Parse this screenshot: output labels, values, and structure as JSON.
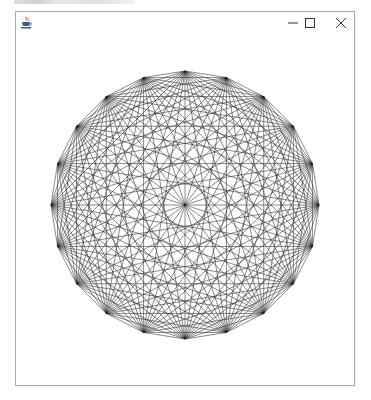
{
  "window": {
    "title": "",
    "icon": "java-coffee-cup-icon",
    "controls": {
      "minimize_glyph": "—",
      "maximize_glyph": "☐",
      "close_glyph": "✕"
    }
  },
  "canvas": {
    "background": "#ffffff",
    "line_color": "#1a1a1a",
    "line_width": 0.6,
    "graph": {
      "type": "complete-graph",
      "vertex_count": 20,
      "center_x": 184,
      "center_y": 204,
      "radius": 134,
      "start_angle_deg": -90
    }
  }
}
